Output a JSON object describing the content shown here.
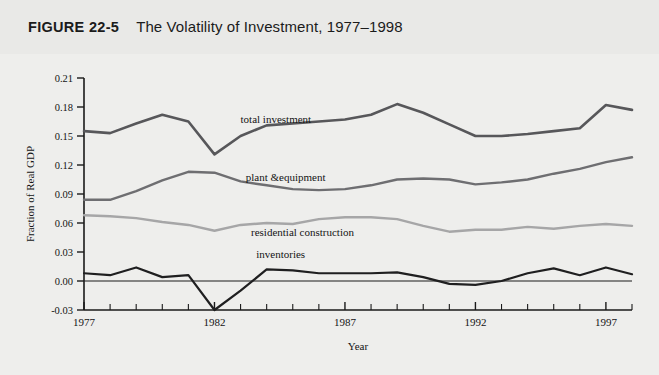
{
  "figure": {
    "number": "FIGURE 22-5",
    "title": "The Volatility of Investment, 1977–1998"
  },
  "chart_data": {
    "type": "line",
    "title": "The Volatility of Investment, 1977–1998",
    "xlabel": "Year",
    "ylabel": "Fraction of Real GDP",
    "xlim": [
      1977,
      1998
    ],
    "ylim": [
      -0.03,
      0.21
    ],
    "yticks": [
      "0.21",
      "0.18",
      "0.15",
      "0.12",
      "0.09",
      "0.06",
      "0.03",
      "0.00",
      "-0.03"
    ],
    "ytick_values": [
      0.21,
      0.18,
      0.15,
      0.12,
      0.09,
      0.06,
      0.03,
      0.0,
      -0.03
    ],
    "xticks": [
      "1977",
      "1982",
      "1987",
      "1992",
      "1997"
    ],
    "xtick_values": [
      1977,
      1982,
      1987,
      1992,
      1997
    ],
    "x": [
      1977,
      1978,
      1979,
      1980,
      1981,
      1982,
      1983,
      1984,
      1985,
      1986,
      1987,
      1988,
      1989,
      1990,
      1991,
      1992,
      1993,
      1994,
      1995,
      1996,
      1997,
      1998
    ],
    "grid": false,
    "legend": "inline-labels",
    "series": [
      {
        "name": "total investment",
        "color": "#57575a",
        "width": 2.6,
        "label_x": 1983.0,
        "label_y": 0.163,
        "values": [
          0.155,
          0.153,
          0.163,
          0.172,
          0.165,
          0.131,
          0.15,
          0.161,
          0.163,
          0.165,
          0.167,
          0.172,
          0.183,
          0.174,
          0.162,
          0.15,
          0.15,
          0.152,
          0.155,
          0.158,
          0.182,
          0.177
        ]
      },
      {
        "name": "plant &equipment",
        "color": "#6e6e71",
        "width": 2.4,
        "label_x": 1983.2,
        "label_y": 0.103,
        "values": [
          0.084,
          0.084,
          0.093,
          0.104,
          0.113,
          0.112,
          0.103,
          0.099,
          0.095,
          0.094,
          0.095,
          0.099,
          0.105,
          0.106,
          0.105,
          0.1,
          0.102,
          0.105,
          0.111,
          0.116,
          0.123,
          0.128
        ]
      },
      {
        "name": "residential construction",
        "color": "#a6a6a7",
        "width": 2.4,
        "label_x": 1983.4,
        "label_y": 0.047,
        "values": [
          0.068,
          0.067,
          0.065,
          0.061,
          0.058,
          0.052,
          0.058,
          0.06,
          0.059,
          0.064,
          0.066,
          0.066,
          0.064,
          0.057,
          0.051,
          0.053,
          0.053,
          0.056,
          0.054,
          0.057,
          0.059,
          0.057
        ]
      },
      {
        "name": "inventories",
        "color": "#1f1f20",
        "width": 2.2,
        "label_x": 1983.6,
        "label_y": 0.024,
        "values": [
          0.008,
          0.006,
          0.014,
          0.004,
          0.006,
          -0.03,
          -0.01,
          0.012,
          0.011,
          0.008,
          0.008,
          0.008,
          0.009,
          0.004,
          -0.003,
          -0.004,
          0.0,
          0.008,
          0.013,
          0.006,
          0.014,
          0.007
        ]
      }
    ]
  }
}
